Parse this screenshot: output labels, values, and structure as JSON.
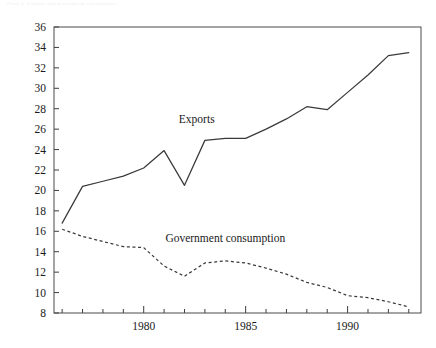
{
  "page": {
    "top_note": "Chart 4.  Exports and government consumption"
  },
  "chart_data": {
    "type": "line",
    "title": "",
    "subtitle": "",
    "xlabel": "",
    "ylabel": "",
    "xlim": [
      1975.6,
      1993.6
    ],
    "ylim": [
      8,
      36
    ],
    "ytick_step": 2,
    "yticks": [
      8,
      10,
      12,
      14,
      16,
      18,
      20,
      22,
      24,
      26,
      28,
      30,
      32,
      34,
      36
    ],
    "ytick_labels": [
      "8",
      "10",
      "12",
      "14",
      "16",
      "18",
      "20",
      "22",
      "24",
      "26",
      "28",
      "30",
      "32",
      "34",
      "36"
    ],
    "xticks": [
      1976,
      1977,
      1978,
      1979,
      1980,
      1981,
      1982,
      1983,
      1984,
      1985,
      1986,
      1987,
      1988,
      1989,
      1990,
      1991,
      1992,
      1993
    ],
    "xtick_labeled": [
      1980,
      1985,
      1990
    ],
    "xtick_labels": [
      "1980",
      "1985",
      "1990"
    ],
    "grid": false,
    "legend_position": "inline-annotations",
    "x": [
      1976,
      1977,
      1978,
      1979,
      1980,
      1981,
      1982,
      1983,
      1984,
      1985,
      1986,
      1987,
      1988,
      1989,
      1990,
      1991,
      1992,
      1993
    ],
    "series": [
      {
        "name": "Exports",
        "style": "solid",
        "color": "#3a3a3a",
        "label_text": "Exports",
        "label_x": 1982.6,
        "label_y": 26.6,
        "values": [
          16.8,
          20.4,
          20.9,
          21.4,
          22.2,
          23.9,
          20.5,
          24.9,
          25.1,
          25.1,
          26.0,
          27.0,
          28.2,
          27.9,
          29.6,
          31.3,
          33.2,
          33.5
        ]
      },
      {
        "name": "Government consumption",
        "style": "dashed",
        "color": "#3a3a3a",
        "label_text": "Government consumption",
        "label_x": 1984.0,
        "label_y": 15.0,
        "values": [
          16.2,
          15.5,
          15.0,
          14.5,
          14.4,
          12.6,
          11.6,
          12.9,
          13.1,
          12.9,
          12.4,
          11.8,
          11.0,
          10.5,
          9.7,
          9.5,
          9.1,
          8.6
        ]
      }
    ]
  }
}
